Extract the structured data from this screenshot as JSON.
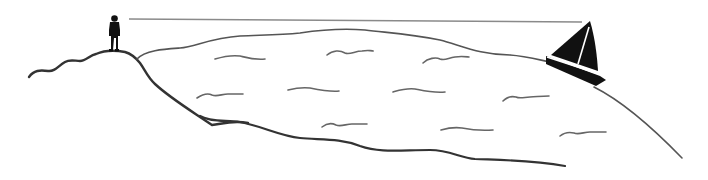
{
  "illustration": {
    "subject": "Observer on a hilltop sighting a sailboat across curved water (line of sight over Earth's curvature)",
    "colors": {
      "background": "#ffffff",
      "ink": "#222222",
      "sightline": "#888888",
      "waves": "#666666",
      "silhouette": "#111111"
    },
    "elements": [
      "observer-figure",
      "hill",
      "sea-surface",
      "sailboat",
      "line-of-sight",
      "waves",
      "shore"
    ]
  }
}
